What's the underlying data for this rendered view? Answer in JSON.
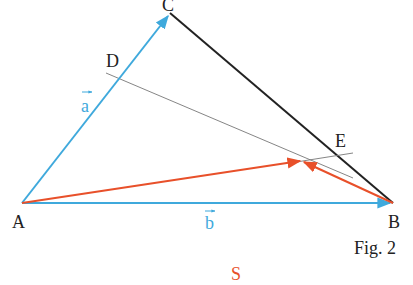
{
  "figure": {
    "caption": "Fig. 2",
    "footer_label": "S",
    "colors": {
      "blue": "#3fa9dc",
      "red": "#e8502a",
      "black": "#222222",
      "gray": "#777777",
      "label": "#222222",
      "footer": "#e8502a"
    },
    "points": {
      "A": {
        "label": "A",
        "x": 22,
        "y": 203
      },
      "B": {
        "label": "B",
        "x": 393,
        "y": 203
      },
      "C": {
        "label": "C",
        "x": 170,
        "y": 13
      },
      "D": {
        "label": "D",
        "x": 118,
        "y": 79
      },
      "E": {
        "label": "E",
        "x": 338,
        "y": 154
      },
      "P": {
        "label": "",
        "x": 302,
        "y": 161
      }
    },
    "vectors": {
      "a": {
        "label": "a",
        "from": "A",
        "to": "C"
      },
      "b": {
        "label": "b",
        "from": "A",
        "to": "B"
      }
    },
    "labels": {
      "A": "A",
      "B": "B",
      "C": "C",
      "D": "D",
      "E": "E",
      "vec_a": "a",
      "vec_b": "b"
    }
  }
}
